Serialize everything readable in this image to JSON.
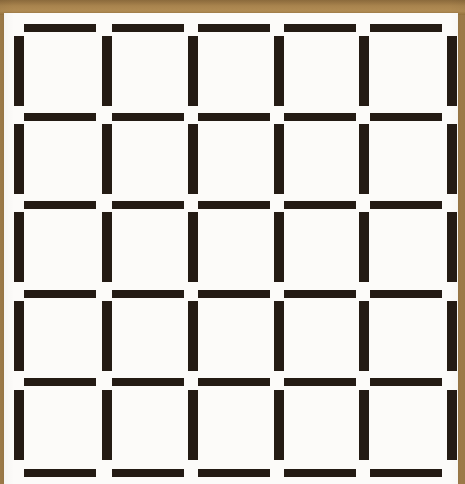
{
  "figure": {
    "kind": "optical-illusion-grid",
    "canvas": {
      "width": 465,
      "height": 484
    },
    "colors": {
      "bar": "#241b14",
      "paper": "#fcfbf9",
      "surface": "#a07d4a",
      "surface_highlight": "#b18c54",
      "surface_shadow": "#8b6a3c"
    },
    "counts": {
      "cells": 25,
      "cell_rows": 5,
      "cell_columns": 5,
      "horizontal_bars": 30,
      "vertical_bars": 30,
      "horizontal_bar_rows": 6,
      "vertical_bar_rows": 5,
      "vertical_bar_columns": 6
    },
    "paper": {
      "x": 4,
      "y": 13,
      "width": 454,
      "height": 471
    },
    "surface_strips": [
      {
        "name": "top",
        "x": 0,
        "y": 0,
        "width": 465,
        "height": 14
      },
      {
        "name": "left",
        "x": 0,
        "y": 13,
        "width": 5,
        "height": 471
      },
      {
        "name": "right",
        "x": 458,
        "y": 13,
        "width": 7,
        "height": 471
      }
    ],
    "geometry": {
      "horizontal_bar_rows_y": [
        24,
        113,
        201,
        290,
        378,
        469
      ],
      "horizontal_bar_columns_x": [
        24,
        112,
        198,
        284,
        370
      ],
      "horizontal_bar_width": 72,
      "horizontal_bar_height": 8,
      "vertical_bar_columns_x": [
        14,
        102,
        188,
        274,
        359,
        447
      ],
      "vertical_bar_rows_y": [
        36,
        124,
        212,
        301,
        390
      ],
      "vertical_bar_width": 10,
      "vertical_bar_height": 70
    }
  }
}
